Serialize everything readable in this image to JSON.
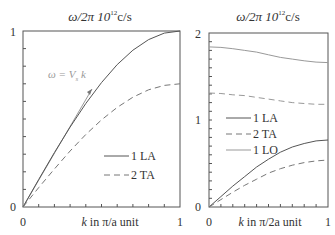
{
  "chart_data": [
    {
      "type": "line",
      "title": "ω/2π 10¹² c/s",
      "xlabel": "k in π/a unit",
      "ylabel": "",
      "xlim": [
        0,
        1
      ],
      "ylim": [
        0,
        1
      ],
      "x_ticks": [
        "0",
        "1"
      ],
      "y_ticks": [
        "0",
        "1"
      ],
      "x": [
        0,
        0.1,
        0.2,
        0.3,
        0.4,
        0.5,
        0.6,
        0.7,
        0.8,
        0.9,
        1.0
      ],
      "series": [
        {
          "name": "1 LA",
          "style": "solid",
          "values": [
            0,
            0.156,
            0.309,
            0.454,
            0.588,
            0.707,
            0.809,
            0.891,
            0.951,
            0.988,
            1.0
          ]
        },
        {
          "name": "2 TA",
          "style": "dashed",
          "values": [
            0,
            0.11,
            0.216,
            0.318,
            0.412,
            0.495,
            0.566,
            0.624,
            0.666,
            0.691,
            0.7
          ]
        }
      ],
      "annotations": [
        {
          "text": "ω = Vs k",
          "type": "tangent-line",
          "from": [
            0,
            0
          ],
          "to": [
            0.44,
            0.66
          ]
        }
      ],
      "legend_position": "lower right",
      "grid": false
    },
    {
      "type": "line",
      "title": "ω/2π 10¹² c/s",
      "xlabel": "k in π/2a unit",
      "ylabel": "",
      "xlim": [
        0,
        1
      ],
      "ylim": [
        0,
        2
      ],
      "x_ticks": [
        "0",
        "1"
      ],
      "y_ticks": [
        "0",
        "1",
        "2"
      ],
      "x": [
        0,
        0.1,
        0.2,
        0.3,
        0.4,
        0.5,
        0.6,
        0.7,
        0.8,
        0.9,
        1.0
      ],
      "series": [
        {
          "name": "1 LA",
          "style": "solid",
          "values": [
            0,
            0.12,
            0.24,
            0.35,
            0.46,
            0.55,
            0.63,
            0.69,
            0.73,
            0.76,
            0.77
          ]
        },
        {
          "name": "2 TA",
          "style": "dashed",
          "values": [
            0,
            0.085,
            0.17,
            0.25,
            0.32,
            0.39,
            0.44,
            0.48,
            0.51,
            0.53,
            0.54
          ]
        },
        {
          "name": "1 LO",
          "style": "solid",
          "values": [
            1.84,
            1.835,
            1.82,
            1.8,
            1.78,
            1.75,
            1.72,
            1.7,
            1.68,
            1.665,
            1.66
          ]
        },
        {
          "name": "2 TO",
          "style": "dashed",
          "values": [
            1.31,
            1.305,
            1.29,
            1.28,
            1.26,
            1.24,
            1.22,
            1.2,
            1.19,
            1.18,
            1.18
          ]
        }
      ],
      "legend_position": "center",
      "grid": false
    }
  ],
  "plots": {
    "left": {
      "title_omega": "ω/2π 10",
      "title_exp": "12",
      "title_unit": "c/s",
      "ytick_top": "1",
      "ytick_bottom": "0",
      "xtick_left": "0",
      "xtick_right": "1",
      "xlabel_k": "k",
      "xlabel_rest": " in π/a unit",
      "annotation": "ω = V",
      "annotation_sub": "s",
      "annotation_k": " k",
      "legend": [
        "1 LA",
        "2 TA"
      ]
    },
    "right": {
      "title_omega": "ω/2π 10",
      "title_exp": "12",
      "title_unit": "c/s",
      "ytick_top": "2",
      "ytick_mid": "1",
      "ytick_bottom": "0",
      "xtick_left": "0",
      "xtick_right": "1",
      "xlabel_k": "k",
      "xlabel_rest": " in π/2a unit",
      "legend": [
        "1 LA",
        "2 TA",
        "1 LO"
      ]
    }
  },
  "colors": {
    "axis": "#555555",
    "line": "#555555",
    "light": "#999999",
    "text": "#333333"
  }
}
